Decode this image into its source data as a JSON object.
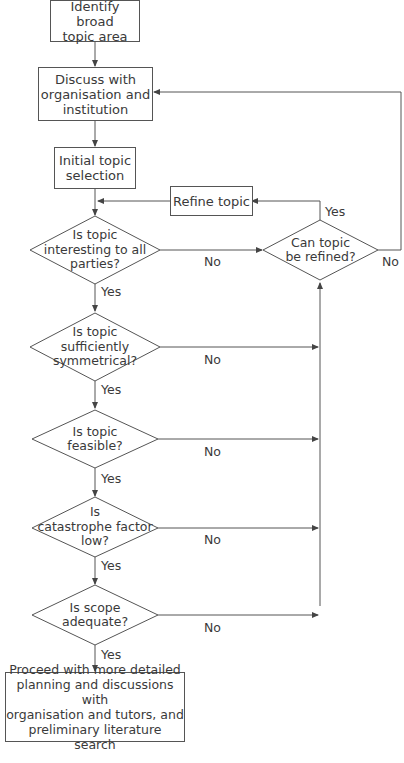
{
  "diagram": {
    "type": "flowchart",
    "nodes": {
      "identify": {
        "shape": "process",
        "lines": [
          "Identify broad",
          "topic area"
        ]
      },
      "discuss": {
        "shape": "process",
        "lines": [
          "Discuss with",
          "organisation and",
          "institution"
        ]
      },
      "initial": {
        "shape": "process",
        "lines": [
          "Initial topic",
          "selection"
        ]
      },
      "refine": {
        "shape": "process",
        "lines": [
          "Refine topic"
        ]
      },
      "interesting": {
        "shape": "decision",
        "lines": [
          "Is topic",
          "interesting to all",
          "parties?"
        ]
      },
      "can_refine": {
        "shape": "decision",
        "lines": [
          "Can topic",
          "be refined?"
        ]
      },
      "symmetrical": {
        "shape": "decision",
        "lines": [
          "Is topic",
          "sufficiently",
          "symmetrical?"
        ]
      },
      "feasible": {
        "shape": "decision",
        "lines": [
          "Is topic",
          "feasible?"
        ]
      },
      "catastrophe": {
        "shape": "decision",
        "lines": [
          "Is",
          "catastrophe factor",
          "low?"
        ]
      },
      "scope": {
        "shape": "decision",
        "lines": [
          "Is scope",
          "adequate?"
        ]
      },
      "proceed": {
        "shape": "process",
        "lines": [
          "Proceed with more detailed",
          "planning and discussions with",
          "organisation and tutors, and",
          "preliminary literature search"
        ]
      }
    },
    "edge_labels": {
      "yes": "Yes",
      "no": "No"
    },
    "edges": [
      {
        "from": "identify",
        "to": "discuss",
        "label": ""
      },
      {
        "from": "discuss",
        "to": "initial",
        "label": ""
      },
      {
        "from": "initial",
        "to": "interesting",
        "label": ""
      },
      {
        "from": "interesting",
        "to": "symmetrical",
        "label": "Yes"
      },
      {
        "from": "interesting",
        "to": "can_refine",
        "label": "No"
      },
      {
        "from": "can_refine",
        "to": "refine",
        "label": "Yes"
      },
      {
        "from": "can_refine",
        "to": "discuss",
        "label": "No"
      },
      {
        "from": "refine",
        "to": "interesting",
        "label": ""
      },
      {
        "from": "symmetrical",
        "to": "feasible",
        "label": "Yes"
      },
      {
        "from": "symmetrical",
        "to": "can_refine",
        "label": "No"
      },
      {
        "from": "feasible",
        "to": "catastrophe",
        "label": "Yes"
      },
      {
        "from": "feasible",
        "to": "can_refine",
        "label": "No"
      },
      {
        "from": "catastrophe",
        "to": "scope",
        "label": "Yes"
      },
      {
        "from": "catastrophe",
        "to": "can_refine",
        "label": "No"
      },
      {
        "from": "scope",
        "to": "proceed",
        "label": "Yes"
      },
      {
        "from": "scope",
        "to": "can_refine",
        "label": "No"
      }
    ],
    "colors": {
      "line": "#555555",
      "text": "#3a3a3a",
      "background": "#ffffff"
    }
  }
}
